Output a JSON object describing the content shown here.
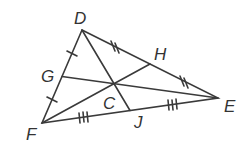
{
  "diagram": {
    "type": "triangle-medians",
    "stroke_color": "#3a3a3a",
    "vertices": {
      "D": {
        "label": "D",
        "x": 82,
        "y": 30
      },
      "E": {
        "label": "E",
        "x": 218,
        "y": 98
      },
      "F": {
        "label": "F",
        "x": 42,
        "y": 123
      }
    },
    "midpoints": {
      "G": {
        "label": "G",
        "x": 62,
        "y": 76.5,
        "side": "DF"
      },
      "H": {
        "label": "H",
        "x": 150,
        "y": 64,
        "side": "DE"
      },
      "J": {
        "label": "J",
        "x": 130,
        "y": 110.5,
        "side": "FE"
      }
    },
    "centroid": {
      "label": "C",
      "x": 114,
      "y": 84
    },
    "labels": {
      "D": {
        "text": "D",
        "x": 74,
        "y": 10
      },
      "E": {
        "text": "E",
        "x": 224,
        "y": 98
      },
      "F": {
        "text": "F",
        "x": 26,
        "y": 126
      },
      "G": {
        "text": "G",
        "x": 41,
        "y": 68
      },
      "H": {
        "text": "H",
        "x": 154,
        "y": 46
      },
      "C": {
        "text": "C",
        "x": 103,
        "y": 95
      },
      "J": {
        "text": "J",
        "x": 134,
        "y": 114
      }
    }
  }
}
